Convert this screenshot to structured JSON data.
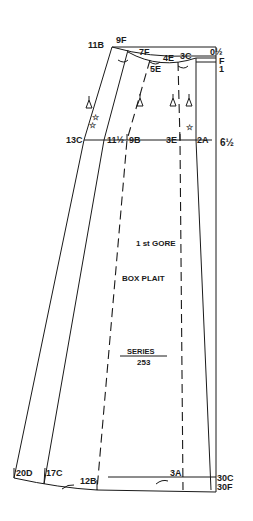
{
  "diagram": {
    "title": "1 st GORE",
    "subtitle": "BOX PLAIT",
    "series_label": "SERIES",
    "series_number": "253",
    "colors": {
      "ink": "#1a1a1a",
      "background": "#ffffff"
    },
    "waist_labels": {
      "left": "11B",
      "nine_f": "9F",
      "seven_f": "7F",
      "four_e": "4E",
      "five_e": "5E",
      "three_c": "3C",
      "right_top": "0½",
      "right_f": "F",
      "right_one": "1"
    },
    "hip_labels": {
      "left": "13C",
      "eleven_half": "11½",
      "nine_b": "9B",
      "three_e": "3E",
      "two_a": "2A",
      "right": "6½"
    },
    "hem_labels": {
      "left": "20D",
      "seventeen_c": "17C",
      "twelve_b": "12B",
      "three_a": "3A",
      "right_c": "30C",
      "right_f": "30F"
    },
    "symbols": [
      "notch-marker",
      "star-marker"
    ]
  }
}
